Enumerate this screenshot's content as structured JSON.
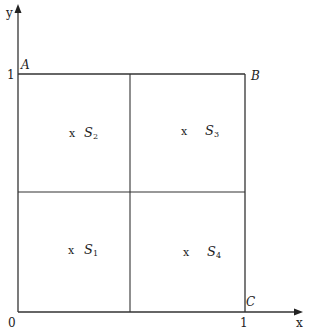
{
  "diagram": {
    "type": "unit-square-partition",
    "axes": {
      "x_label": "x",
      "y_label": "y",
      "origin_label": "0",
      "x_tick_label": "1",
      "y_tick_label": "1"
    },
    "corners": {
      "A": "A",
      "B": "B",
      "C": "C"
    },
    "regions": [
      {
        "id": "S1",
        "marker": "x",
        "name": "S",
        "sub": "1",
        "quadrant": "bottom-left"
      },
      {
        "id": "S2",
        "marker": "x",
        "name": "S",
        "sub": "2",
        "quadrant": "top-left"
      },
      {
        "id": "S3",
        "marker": "x",
        "name": "S",
        "sub": "3",
        "quadrant": "top-right"
      },
      {
        "id": "S4",
        "marker": "x",
        "name": "S",
        "sub": "4",
        "quadrant": "bottom-right"
      }
    ],
    "colors": {
      "line": "#333333",
      "text": "#222222",
      "background": "#ffffff"
    }
  }
}
